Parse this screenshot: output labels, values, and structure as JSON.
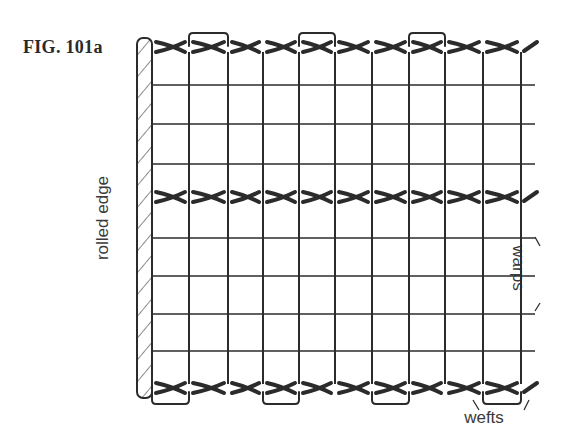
{
  "figure": {
    "label": "FIG. 101a"
  },
  "labels": {
    "rolled_edge": "rolled edge",
    "warps": "warps",
    "wefts": "wefts"
  },
  "diagram": {
    "warp_x": [
      152,
      189,
      228,
      263,
      299,
      335,
      372,
      409,
      445,
      483,
      521
    ],
    "grid_line_y": [
      85,
      124,
      164,
      238,
      276,
      314,
      351
    ],
    "weft_rows_y": [
      47,
      197,
      388
    ],
    "rolled_edge": {
      "x": 137,
      "width": 15,
      "top": 38,
      "bottom": 398
    },
    "colors": {
      "ink": "#2b2b2b",
      "background": "#ffffff"
    }
  }
}
